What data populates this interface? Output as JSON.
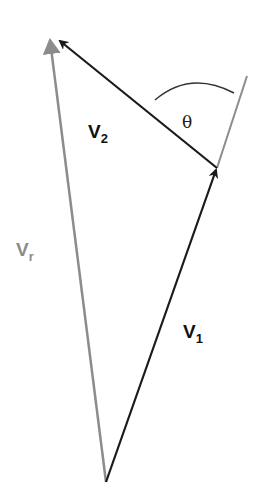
{
  "diagram": {
    "type": "vector-triangle",
    "colors": {
      "background": "#ffffff",
      "black_vector": "#1a1a1a",
      "gray_vector": "#8c8c8c",
      "arc": "#333333"
    },
    "vectors": [
      {
        "id": "v1",
        "label_main": "V",
        "label_sub": "1",
        "color": "black"
      },
      {
        "id": "v2",
        "label_main": "V",
        "label_sub": "2",
        "color": "black"
      },
      {
        "id": "vr",
        "label_main": "V",
        "label_sub": "r",
        "color": "gray"
      }
    ],
    "angle_label": "θ"
  }
}
